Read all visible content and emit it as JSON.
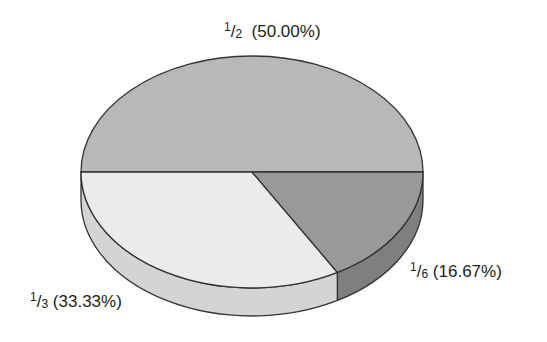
{
  "chart_data": {
    "type": "pie",
    "style": "3d",
    "title": "",
    "categories": [
      "1/2",
      "1/3",
      "1/6"
    ],
    "values": [
      50.0,
      33.33,
      16.67
    ],
    "labels": [
      "1/2 (50.00%)",
      "1/3 (33.33%)",
      "1/6 (16.67%)"
    ],
    "slices": [
      {
        "fraction": "1/2",
        "numerator": "1",
        "denominator": "2",
        "percent": "(50.00%)",
        "value": 50.0,
        "color": "#b8b8b8",
        "side_color": "#a0a0a0"
      },
      {
        "fraction": "1/3",
        "numerator": "1",
        "denominator": "3",
        "percent": "(33.33%)",
        "value": 33.33,
        "color": "#ebebeb",
        "side_color": "#d4d4d4"
      },
      {
        "fraction": "1/6",
        "numerator": "1",
        "denominator": "6",
        "percent": "(16.67%)",
        "value": 16.67,
        "color": "#999999",
        "side_color": "#7f7f7f"
      }
    ],
    "legend": "none",
    "grid": false
  }
}
